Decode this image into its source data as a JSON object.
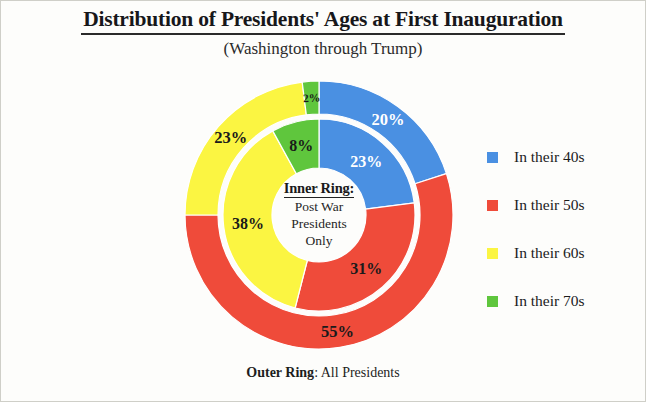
{
  "title": "Distribution of Presidents' Ages at First Inauguration",
  "subtitle": "(Washington through Trump)",
  "center": {
    "heading": "Inner Ring:",
    "line1": "Post War",
    "line2": "Presidents",
    "line3": "Only"
  },
  "footer": {
    "label": "Outer Ring",
    "text": ": All Presidents"
  },
  "legend": {
    "items": [
      {
        "label": "In their 40s",
        "color": "#4a90e2"
      },
      {
        "label": "In their 50s",
        "color": "#ef4b3a"
      },
      {
        "label": "In their 60s",
        "color": "#fbf542"
      },
      {
        "label": "In their 70s",
        "color": "#5fc63d"
      }
    ]
  },
  "chart_data": {
    "type": "pie",
    "variant": "double-donut",
    "title": "Distribution of Presidents' Ages at First Inauguration",
    "subtitle": "(Washington through Trump)",
    "categories": [
      "In their 40s",
      "In their 50s",
      "In their 60s",
      "In their 70s"
    ],
    "colors": [
      "#4a90e2",
      "#ef4b3a",
      "#fbf542",
      "#5fc63d"
    ],
    "legend_position": "right",
    "start_angle_deg": 0,
    "direction": "clockwise",
    "series": [
      {
        "name": "Outer Ring: All Presidents",
        "ring": "outer",
        "values": [
          20,
          55,
          23,
          2
        ],
        "labels": [
          "20%",
          "55%",
          "23%",
          "2%"
        ],
        "label_colors": [
          "#ffffff",
          "#1a1a1a",
          "#1a1a1a",
          "#1a1a1a"
        ],
        "label_rotated": [
          false,
          false,
          false,
          true
        ],
        "inner_radius": 101,
        "outer_radius": 134
      },
      {
        "name": "Inner Ring: Post War Presidents Only",
        "ring": "inner",
        "values": [
          23,
          31,
          38,
          8
        ],
        "labels": [
          "23%",
          "31%",
          "38%",
          "8%"
        ],
        "label_colors": [
          "#ffffff",
          "#1a1a1a",
          "#1a1a1a",
          "#1a1a1a"
        ],
        "label_rotated": [
          false,
          false,
          false,
          false
        ],
        "inner_radius": 47,
        "outer_radius": 96
      }
    ],
    "center_text": [
      "Inner Ring:",
      "Post War",
      "Presidents",
      "Only"
    ],
    "footer_text": "Outer Ring: All Presidents"
  }
}
